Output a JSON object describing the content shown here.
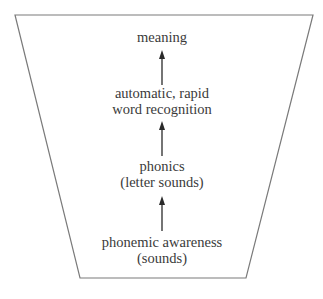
{
  "diagram": {
    "type": "funnel-flow",
    "direction": "bottom-to-top",
    "stages": [
      {
        "lines": [
          "phonemic awareness",
          "(sounds)"
        ]
      },
      {
        "lines": [
          "phonics",
          "(letter sounds)"
        ]
      },
      {
        "lines": [
          "automatic, rapid",
          "word recognition"
        ]
      },
      {
        "lines": [
          "meaning"
        ]
      }
    ],
    "colors": {
      "outline": "#7a7a7a",
      "text": "#3a3a3a",
      "arrow": "#2a2a2a",
      "background": "#ffffff"
    }
  }
}
